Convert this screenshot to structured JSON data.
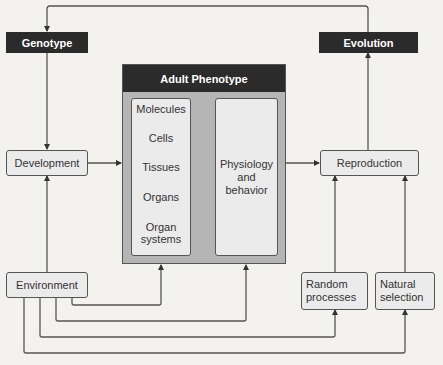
{
  "nodes": {
    "genotype": "Genotype",
    "evolution": "Evolution",
    "development": "Development",
    "reproduction": "Reproduction",
    "environment": "Environment",
    "random_processes": "Random processes",
    "natural_selection": "Natural selection",
    "adult_phenotype": {
      "title": "Adult Phenotype",
      "levels": [
        "Molecules",
        "Cells",
        "Tissues",
        "Organs",
        "Organ systems"
      ],
      "physiology": "Physiology and behavior"
    }
  },
  "edges": [
    {
      "from": "Evolution",
      "to": "Genotype"
    },
    {
      "from": "Genotype",
      "to": "Development"
    },
    {
      "from": "Development",
      "to": "Adult Phenotype"
    },
    {
      "from": "Organization levels",
      "to": "Physiology and behavior"
    },
    {
      "from": "Physiology and behavior",
      "to": "Reproduction"
    },
    {
      "from": "Reproduction",
      "to": "Evolution"
    },
    {
      "from": "Environment",
      "to": "Development"
    },
    {
      "from": "Environment",
      "to": "Organization levels"
    },
    {
      "from": "Environment",
      "to": "Physiology and behavior"
    },
    {
      "from": "Environment",
      "to": "Random processes"
    },
    {
      "from": "Environment",
      "to": "Natural selection"
    },
    {
      "from": "Random processes",
      "to": "Reproduction"
    },
    {
      "from": "Natural selection",
      "to": "Reproduction"
    }
  ],
  "colors": {
    "dark": "#2b2b2b",
    "box": "#ebebeb",
    "phenotype_bg": "#b5b5b5",
    "line": "#555555"
  }
}
